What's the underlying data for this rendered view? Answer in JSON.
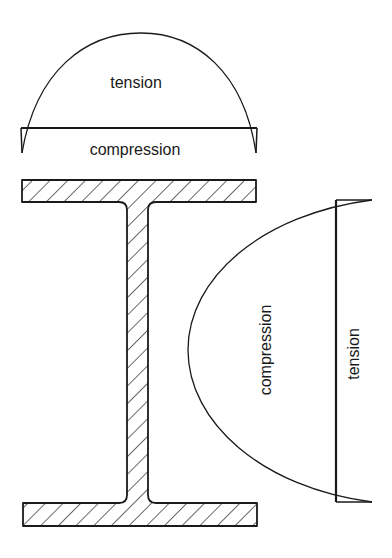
{
  "figure": {
    "colors": {
      "line": "#1a1a1a",
      "background": "#ffffff"
    }
  },
  "flange_stress_diagram": {
    "upper_label": "tension",
    "lower_label": "compression"
  },
  "web_stress_diagram": {
    "inner_label": "compression",
    "outer_label": "tension"
  },
  "section": {
    "shape": "I-beam",
    "fill": "hatched"
  }
}
